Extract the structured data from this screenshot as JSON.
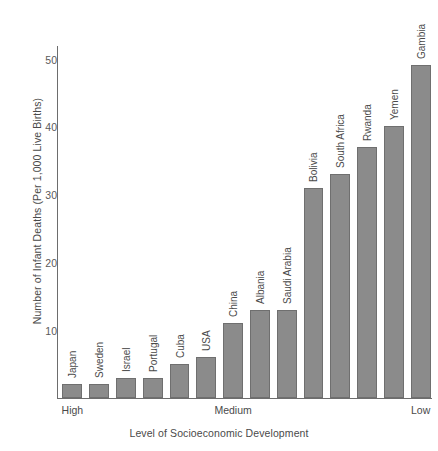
{
  "chart_data": {
    "type": "bar",
    "title": "",
    "xlabel": "Level of Socioeconomic Development",
    "ylabel": "Number of Infant Deaths (Per 1,000 Live Births)",
    "categories": [
      "Japan",
      "Sweden",
      "Israel",
      "Portugal",
      "Cuba",
      "USA",
      "China",
      "Albania",
      "Saudi Arabia",
      "Bolivia",
      "South Africa",
      "Rwanda",
      "Yemen",
      "Gambia"
    ],
    "values": [
      2,
      2,
      3,
      3,
      5,
      6,
      11,
      13,
      13,
      31,
      33,
      37,
      40,
      49
    ],
    "ylim": [
      0,
      52
    ],
    "yticks": [
      10,
      20,
      30,
      40,
      50
    ],
    "ytick_labels": [
      "10",
      "20",
      "30",
      "40",
      "50"
    ],
    "x_group_labels": [
      "High",
      "Medium",
      "Low"
    ],
    "grid": false,
    "legend": "none",
    "bar_color": "#8b8b8b",
    "bar_border_color": "#6f6f6f",
    "axis_color": "#6d6d6d",
    "text_color": "#4a4a4a",
    "background": "#ffffff"
  }
}
